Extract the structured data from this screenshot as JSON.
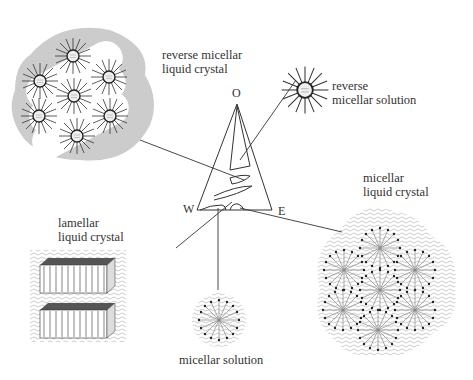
{
  "diagram": {
    "type": "phase-diagram",
    "triangle": {
      "vertices": [
        {
          "label": "O",
          "x": 237,
          "y": 100
        },
        {
          "label": "W",
          "x": 197,
          "y": 210
        },
        {
          "label": "E",
          "x": 272,
          "y": 210
        }
      ]
    },
    "structures": [
      {
        "id": "reverse-micellar-lc",
        "label_line1": "reverse micellar",
        "label_line2": "liquid crystal"
      },
      {
        "id": "reverse-micellar-solution",
        "label_line1": "reverse",
        "label_line2": "micellar solution"
      },
      {
        "id": "micellar-lc",
        "label_line1": "micellar",
        "label_line2": "liquid crystal"
      },
      {
        "id": "lamellar-lc",
        "label_line1": "lamellar",
        "label_line2": "liquid crystal"
      },
      {
        "id": "micellar-solution",
        "label_line1": "micellar solution",
        "label_line2": ""
      }
    ],
    "colors": {
      "line": "#333333",
      "halo": "#cccccc",
      "water": "#aaaaaa"
    }
  }
}
